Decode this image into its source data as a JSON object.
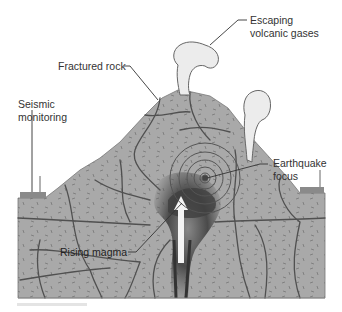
{
  "diagram": {
    "labels": {
      "escaping_gases": [
        "Escaping",
        "volcanic gases"
      ],
      "fractured_rock": "Fractured rock",
      "seismic_monitoring": [
        "Seismic",
        "monitoring"
      ],
      "earthquake_focus": [
        "Earthquake",
        "focus"
      ],
      "rising_magma": "Rising magma"
    },
    "colors": {
      "rock": "#a8a8a8",
      "fracture": "#4a4a4a",
      "magma_dark": "#3c3c3c",
      "plume": "#ececec",
      "text": "#333333"
    }
  }
}
